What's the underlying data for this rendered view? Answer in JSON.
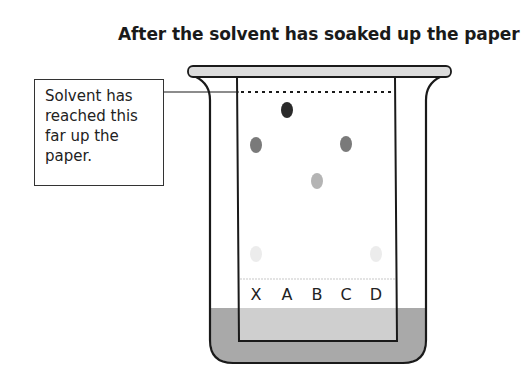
{
  "title": "After the solvent has soaked up the paper",
  "callout": {
    "lines": [
      "Solvent has",
      "reached this",
      "far up the",
      "paper."
    ]
  },
  "lanes": [
    {
      "label": "X",
      "x": 256
    },
    {
      "label": "A",
      "x": 287
    },
    {
      "label": "B",
      "x": 317
    },
    {
      "label": "C",
      "x": 346
    },
    {
      "label": "D",
      "x": 376
    }
  ],
  "spots": [
    {
      "lane": "A",
      "x": 287,
      "y": 110,
      "color": "#2a2a2a"
    },
    {
      "lane": "X",
      "x": 256,
      "y": 145,
      "color": "#7a7a7a"
    },
    {
      "lane": "C",
      "x": 346,
      "y": 144,
      "color": "#7a7a7a"
    },
    {
      "lane": "B",
      "x": 317,
      "y": 181,
      "color": "#b4b4b4"
    },
    {
      "lane": "X",
      "x": 256,
      "y": 254,
      "color": "#ececec"
    },
    {
      "lane": "D",
      "x": 376,
      "y": 254,
      "color": "#ececec"
    }
  ],
  "colors": {
    "solvent": "#a9a9a9",
    "solvent_in_paper": "#cfcfcf",
    "lid": "#dcdcdc",
    "outline": "#1a1a1a"
  }
}
